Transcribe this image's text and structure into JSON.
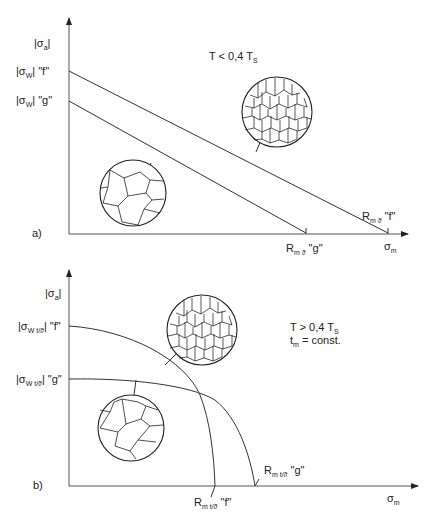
{
  "panel_a": {
    "label": "a)",
    "y_axis_label": "|σ",
    "y_axis_sub": "a",
    "x_axis_label": "σ",
    "x_axis_sub": "m",
    "condition": "T < 0,4 T",
    "condition_sub": "S",
    "f_intercept_label_pre": "|σ",
    "f_intercept_sub": "W",
    "f_intercept_label_post": "| \"f\"",
    "g_intercept_label_pre": "|σ",
    "g_intercept_sub": "W",
    "g_intercept_label_post": "| \"g\"",
    "rm_f_label": "R",
    "rm_f_sub": "m ϑ",
    "rm_f_post": " \"f\"",
    "rm_g_label": "R",
    "rm_g_sub": "m ϑ",
    "rm_g_post": " \"g\"",
    "fine_grain_icon": "fine-grain-microstructure",
    "coarse_grain_icon": "coarse-grain-microstructure"
  },
  "panel_b": {
    "label": "b)",
    "y_axis_label": "|σ",
    "y_axis_sub": "a",
    "x_axis_label": "σ",
    "x_axis_sub": "m",
    "condition_line1": "T > 0,4 T",
    "condition_line1_sub": "S",
    "condition_line2_pre": "t",
    "condition_line2_sub": "m",
    "condition_line2_post": " = const.",
    "f_intercept_label_pre": "|σ",
    "f_intercept_sub": "W t/ϑ",
    "f_intercept_label_post": "| \"f\"",
    "g_intercept_label_pre": "|σ",
    "g_intercept_sub": "W t/ϑ",
    "g_intercept_label_post": "| \"g\"",
    "rm_f_label": "R",
    "rm_f_sub": "m t/ϑ",
    "rm_f_post": " \"f\"",
    "rm_g_label": "R",
    "rm_g_sub": "m t/ϑ",
    "rm_g_post": " \"g\"",
    "fine_grain_icon": "fine-grain-microstructure",
    "coarse_grain_icon": "coarse-grain-microstructure"
  }
}
